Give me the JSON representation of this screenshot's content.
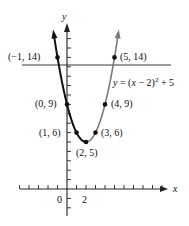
{
  "chart_data": {
    "type": "line",
    "title": "",
    "equation_label": "y = (x − 2)² + 5",
    "equation_parts": {
      "lhs": "y",
      "eq": " = (",
      "x": "x",
      "rest": " − 2)",
      "sup": "2",
      "tail": " + 5"
    },
    "xlabel": "x",
    "ylabel": "y",
    "x_tick_labels": [
      {
        "value": 0,
        "label": "0"
      },
      {
        "value": 2,
        "label": "2"
      }
    ],
    "xlim": [
      -5,
      10
    ],
    "ylim": [
      -3,
      17
    ],
    "grid": false,
    "horizontal_line_y": 13.2,
    "series": [
      {
        "name": "left branch",
        "color": "#111111",
        "x_range": [
          -1.46,
          2
        ]
      },
      {
        "name": "right branch",
        "color": "#7a7a7a",
        "x_range": [
          2,
          5.46
        ]
      }
    ],
    "points": [
      {
        "x": -1,
        "y": 14,
        "label": "(−1, 14)"
      },
      {
        "x": 0,
        "y": 9,
        "label": "(0, 9)"
      },
      {
        "x": 1,
        "y": 6,
        "label": "(1, 6)"
      },
      {
        "x": 2,
        "y": 5,
        "label": "(2, 5)"
      },
      {
        "x": 3,
        "y": 6,
        "label": "(3, 6)"
      },
      {
        "x": 4,
        "y": 9,
        "label": "(4, 9)"
      },
      {
        "x": 5,
        "y": 14,
        "label": "(5, 14)"
      }
    ]
  }
}
